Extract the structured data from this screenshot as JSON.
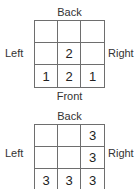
{
  "views": [
    {
      "labels": {
        "back": "Back",
        "front": "Front",
        "left": "Left",
        "right": "Right"
      },
      "grid": [
        [
          "",
          "",
          ""
        ],
        [
          "",
          "2",
          ""
        ],
        [
          "1",
          "2",
          "1"
        ]
      ]
    },
    {
      "labels": {
        "back": "Back",
        "left": "Left",
        "right": "Right"
      },
      "grid": [
        [
          "",
          "",
          "3"
        ],
        [
          "",
          "",
          "3"
        ],
        [
          "3",
          "3",
          "3"
        ]
      ]
    }
  ]
}
